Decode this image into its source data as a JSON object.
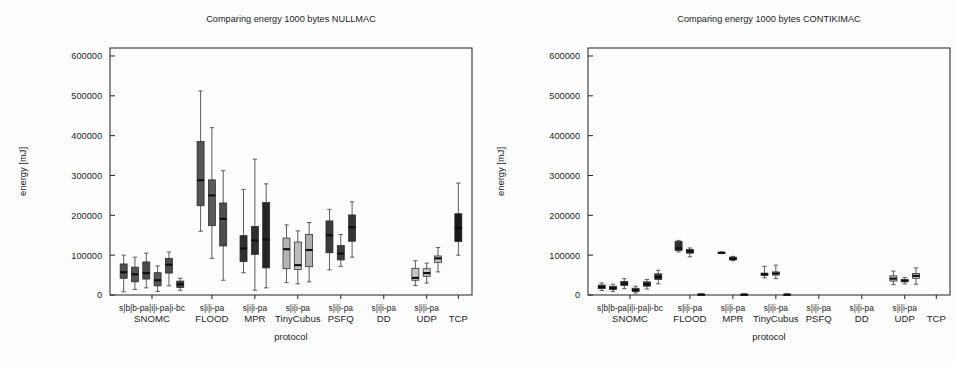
{
  "figure": {
    "width": 955,
    "height": 366,
    "background": "#fdfdfd",
    "ink": "#1c1c1c"
  },
  "panels": [
    {
      "id": "nullmac",
      "title": "Comparing energy 1000 bytes NULLMAC",
      "xlabel": "protocol",
      "ylabel": "energy [mJ]"
    },
    {
      "id": "contikimac",
      "title": "Comparing energy 1000 bytes CONTIKIMAC",
      "xlabel": "protocol",
      "ylabel": "energy [mJ]"
    }
  ],
  "chart_data": [
    {
      "type": "box",
      "id": "nullmac",
      "title": "Comparing energy 1000 bytes NULLMAC",
      "xlabel": "protocol",
      "ylabel": "energy [mJ]",
      "ylim": [
        0,
        620000
      ],
      "yticks": [
        0,
        100000,
        200000,
        300000,
        400000,
        500000,
        600000
      ],
      "yticklabels": [
        "0",
        "100000",
        "200000",
        "300000",
        "400000",
        "500000",
        "600000"
      ],
      "grid": false,
      "legend": "none",
      "groups": [
        {
          "name": "SNOMC",
          "variants": [
            "s",
            "b",
            "b-pa",
            "i",
            "i-pa",
            "i-bc"
          ],
          "variant_label": "s|b|b-pa|i|i-pa|i-bc",
          "boxes": [
            {
              "variant": "s",
              "whisker_low": 8000,
              "q1": 42000,
              "median": 57000,
              "q3": 78000,
              "whisker_high": 100000,
              "color": "#4f4f4f"
            },
            {
              "variant": "b",
              "whisker_low": 14000,
              "q1": 33000,
              "median": 52000,
              "q3": 70000,
              "whisker_high": 95000,
              "color": "#545454"
            },
            {
              "variant": "b-pa",
              "whisker_low": 18000,
              "q1": 40000,
              "median": 55000,
              "q3": 83000,
              "whisker_high": 105000,
              "color": "#4a4a4a"
            },
            {
              "variant": "i",
              "whisker_low": 9000,
              "q1": 23000,
              "median": 37000,
              "q3": 56000,
              "whisker_high": 73000,
              "color": "#585858"
            },
            {
              "variant": "i-pa",
              "whisker_low": 23000,
              "q1": 55000,
              "median": 76000,
              "q3": 92000,
              "whisker_high": 108000,
              "color": "#4c4c4c"
            },
            {
              "variant": "i-bc",
              "whisker_low": 12000,
              "q1": 19000,
              "median": 27000,
              "q3": 35000,
              "whisker_high": 42000,
              "color": "#3f3f3f"
            }
          ]
        },
        {
          "name": "FLOOD",
          "variants": [
            "s",
            "i",
            "i-pa"
          ],
          "variant_label": "s|i|i-pa",
          "boxes": [
            {
              "variant": "s",
              "whisker_low": 160000,
              "q1": 224000,
              "median": 288000,
              "q3": 385000,
              "whisker_high": 512000,
              "color": "#555555"
            },
            {
              "variant": "i",
              "whisker_low": 92000,
              "q1": 174000,
              "median": 250000,
              "q3": 289000,
              "whisker_high": 420000,
              "color": "#5b5b5b"
            },
            {
              "variant": "i-pa",
              "whisker_low": 37000,
              "q1": 123000,
              "median": 191000,
              "q3": 231000,
              "whisker_high": 312000,
              "color": "#4d4d4d"
            }
          ]
        },
        {
          "name": "MPR",
          "variants": [
            "s",
            "i",
            "i-pa"
          ],
          "variant_label": "s|i|i-pa",
          "boxes": [
            {
              "variant": "s",
              "whisker_low": 56000,
              "q1": 84000,
              "median": 117000,
              "q3": 149000,
              "whisker_high": 265000,
              "color": "#303030"
            },
            {
              "variant": "i",
              "whisker_low": 12000,
              "q1": 102000,
              "median": 137000,
              "q3": 172000,
              "whisker_high": 341000,
              "color": "#2e2e2e"
            },
            {
              "variant": "i-pa",
              "whisker_low": 18000,
              "q1": 68000,
              "median": 139000,
              "q3": 232000,
              "whisker_high": 279000,
              "color": "#262626"
            }
          ]
        },
        {
          "name": "TinyCubus",
          "variants": [
            "s",
            "i",
            "i-pa"
          ],
          "variant_label": "s|i|i-pa",
          "boxes": [
            {
              "variant": "s",
              "whisker_low": 31000,
              "q1": 66000,
              "median": 115000,
              "q3": 143000,
              "whisker_high": 176000,
              "color": "#b5b5b5"
            },
            {
              "variant": "i",
              "whisker_low": 28000,
              "q1": 64000,
              "median": 75000,
              "q3": 133000,
              "whisker_high": 161000,
              "color": "#bcbcbc"
            },
            {
              "variant": "i-pa",
              "whisker_low": 33000,
              "q1": 71000,
              "median": 113000,
              "q3": 152000,
              "whisker_high": 182000,
              "color": "#aeaeae"
            }
          ]
        },
        {
          "name": "PSFQ",
          "variants": [
            "s",
            "i",
            "i-pa"
          ],
          "variant_label": "s|i|i-pa",
          "boxes": [
            {
              "variant": "s",
              "whisker_low": 63000,
              "q1": 106000,
              "median": 150000,
              "q3": 186000,
              "whisker_high": 215000,
              "color": "#3a3a3a"
            },
            {
              "variant": "i",
              "whisker_low": 72000,
              "q1": 88000,
              "median": 104000,
              "q3": 124000,
              "whisker_high": 152000,
              "color": "#3c3c3c"
            },
            {
              "variant": "i-pa",
              "whisker_low": 95000,
              "q1": 135000,
              "median": 170000,
              "q3": 201000,
              "whisker_high": 234000,
              "color": "#343434"
            }
          ]
        },
        {
          "name": "DD",
          "variants": [
            "s",
            "i",
            "i-pa"
          ],
          "variant_label": "s|i|i-pa",
          "boxes": []
        },
        {
          "name": "UDP",
          "variants": [
            "s",
            "i",
            "i-pa"
          ],
          "variant_label": "s|i|i-pa",
          "boxes": [
            {
              "variant": "s",
              "whisker_low": 24000,
              "q1": 37000,
              "median": 43000,
              "q3": 67000,
              "whisker_high": 86000,
              "color": "#c6c6c6"
            },
            {
              "variant": "i",
              "whisker_low": 30000,
              "q1": 47000,
              "median": 55000,
              "q3": 66000,
              "whisker_high": 80000,
              "color": "#c9c9c9"
            },
            {
              "variant": "i-pa",
              "whisker_low": 58000,
              "q1": 82000,
              "median": 92000,
              "q3": 98000,
              "whisker_high": 119000,
              "color": "#c0c0c0"
            }
          ]
        },
        {
          "name": "TCP",
          "variants": [
            ""
          ],
          "variant_label": "",
          "boxes": [
            {
              "variant": "",
              "whisker_low": 100000,
              "q1": 134000,
              "median": 168000,
              "q3": 204000,
              "whisker_high": 281000,
              "color": "#1a1a1a"
            }
          ]
        }
      ]
    },
    {
      "type": "box",
      "id": "contikimac",
      "title": "Comparing energy 1000 bytes CONTIKIMAC",
      "xlabel": "protocol",
      "ylabel": "energy [mJ]",
      "ylim": [
        0,
        620000
      ],
      "yticks": [
        0,
        100000,
        200000,
        300000,
        400000,
        500000,
        600000
      ],
      "yticklabels": [
        "0",
        "100000",
        "200000",
        "300000",
        "400000",
        "500000",
        "600000"
      ],
      "grid": false,
      "legend": "none",
      "groups": [
        {
          "name": "SNOMC",
          "variants": [
            "s",
            "b",
            "b-pa",
            "i",
            "i-pa",
            "i-bc"
          ],
          "variant_label": "s|b|b-pa|i|i-pa|i-bc",
          "boxes": [
            {
              "variant": "s",
              "whisker_low": 11000,
              "q1": 16000,
              "median": 20000,
              "q3": 25000,
              "whisker_high": 30000,
              "color": "#3d3d3d"
            },
            {
              "variant": "b",
              "whisker_low": 9000,
              "q1": 14000,
              "median": 17000,
              "q3": 22000,
              "whisker_high": 27000,
              "color": "#414141"
            },
            {
              "variant": "b-pa",
              "whisker_low": 16000,
              "q1": 24000,
              "median": 29000,
              "q3": 34000,
              "whisker_high": 41000,
              "color": "#3a3a3a"
            },
            {
              "variant": "i",
              "whisker_low": 5000,
              "q1": 9000,
              "median": 12000,
              "q3": 17000,
              "whisker_high": 22000,
              "color": "#454545"
            },
            {
              "variant": "i-pa",
              "whisker_low": 15000,
              "q1": 22000,
              "median": 27000,
              "q3": 33000,
              "whisker_high": 39000,
              "color": "#3b3b3b"
            },
            {
              "variant": "i-bc",
              "whisker_low": 28000,
              "q1": 39000,
              "median": 45000,
              "q3": 53000,
              "whisker_high": 62000,
              "color": "#343434"
            }
          ]
        },
        {
          "name": "FLOOD",
          "variants": [
            "s",
            "i",
            "i-pa"
          ],
          "variant_label": "s|i|i-pa",
          "boxes": [
            {
              "variant": "s",
              "whisker_low": 108000,
              "q1": 112000,
              "median": 117000,
              "q3": 134000,
              "whisker_high": 137000,
              "color": "#2f2f2f"
            },
            {
              "variant": "i",
              "whisker_low": 96000,
              "q1": 105000,
              "median": 110000,
              "q3": 114000,
              "whisker_high": 118000,
              "color": "#333333"
            },
            {
              "variant": "i-pa",
              "whisker_low": 800,
              "q1": 1000,
              "median": 1400,
              "q3": 1800,
              "whisker_high": 2200,
              "color": "#2c2c2c"
            }
          ]
        },
        {
          "name": "MPR",
          "variants": [
            "s",
            "i",
            "i-pa"
          ],
          "variant_label": "s|i|i-pa",
          "boxes": [
            {
              "variant": "s",
              "whisker_low": 104000,
              "q1": 105000,
              "median": 106000,
              "q3": 107000,
              "whisker_high": 108000,
              "color": "#242424"
            },
            {
              "variant": "i",
              "whisker_low": 86000,
              "q1": 88000,
              "median": 91000,
              "q3": 95000,
              "whisker_high": 97000,
              "color": "#212121"
            },
            {
              "variant": "i-pa",
              "whisker_low": 700,
              "q1": 900,
              "median": 1200,
              "q3": 1600,
              "whisker_high": 2000,
              "color": "#282828"
            }
          ]
        },
        {
          "name": "TinyCubus",
          "variants": [
            "s",
            "i",
            "i-pa"
          ],
          "variant_label": "s|i|i-pa",
          "boxes": [
            {
              "variant": "s",
              "whisker_low": 43000,
              "q1": 49000,
              "median": 52000,
              "q3": 55000,
              "whisker_high": 72000,
              "color": "#9a9a9a"
            },
            {
              "variant": "i",
              "whisker_low": 41000,
              "q1": 50000,
              "median": 54000,
              "q3": 58000,
              "whisker_high": 75000,
              "color": "#9e9e9e"
            },
            {
              "variant": "i-pa",
              "whisker_low": 700,
              "q1": 900,
              "median": 1200,
              "q3": 1600,
              "whisker_high": 2000,
              "color": "#2c2c2c"
            }
          ]
        },
        {
          "name": "PSFQ",
          "variants": [
            "s",
            "i",
            "i-pa"
          ],
          "variant_label": "s|i|i-pa",
          "boxes": []
        },
        {
          "name": "DD",
          "variants": [
            "s",
            "i",
            "i-pa"
          ],
          "variant_label": "s|i|i-pa",
          "boxes": []
        },
        {
          "name": "UDP",
          "variants": [
            "s",
            "i",
            "i-pa"
          ],
          "variant_label": "s|i|i-pa",
          "boxes": [
            {
              "variant": "s",
              "whisker_low": 26000,
              "q1": 35000,
              "median": 41000,
              "q3": 48000,
              "whisker_high": 60000,
              "color": "#c2c2c2"
            },
            {
              "variant": "i",
              "whisker_low": 28000,
              "q1": 33000,
              "median": 36000,
              "q3": 39000,
              "whisker_high": 44000,
              "color": "#c6c6c6"
            },
            {
              "variant": "i-pa",
              "whisker_low": 27000,
              "q1": 42000,
              "median": 48000,
              "q3": 54000,
              "whisker_high": 68000,
              "color": "#bdbdbd"
            }
          ]
        },
        {
          "name": "TCP",
          "variants": [
            ""
          ],
          "variant_label": "",
          "boxes": []
        }
      ]
    }
  ]
}
